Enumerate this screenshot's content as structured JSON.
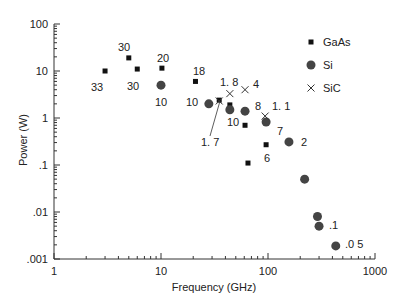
{
  "chart_data": {
    "type": "scatter",
    "title": "",
    "xlabel": "Frequency (GHz)",
    "ylabel": "Power (W)",
    "xscale": "log",
    "yscale": "log",
    "xlim": [
      1,
      1000
    ],
    "ylim": [
      0.001,
      100
    ],
    "x_ticks": [
      "1",
      "10",
      "100",
      "1000"
    ],
    "y_ticks": [
      "100",
      "10",
      "1",
      ".1",
      ".01",
      ".001"
    ],
    "grid": false,
    "legend_position": "upper right",
    "legend": [
      {
        "name": "GaAs",
        "marker": "square"
      },
      {
        "name": "Si",
        "marker": "circle"
      },
      {
        "name": "SiC",
        "marker": "x"
      }
    ],
    "series": [
      {
        "name": "GaAs",
        "marker": "square",
        "points": [
          {
            "x": 3,
            "y": 10
          },
          {
            "x": 5,
            "y": 19
          },
          {
            "x": 6,
            "y": 11
          },
          {
            "x": 10.2,
            "y": 11.5
          },
          {
            "x": 21,
            "y": 6
          },
          {
            "x": 35,
            "y": 2.4
          },
          {
            "x": 44,
            "y": 1.9
          },
          {
            "x": 61,
            "y": 0.7
          },
          {
            "x": 96,
            "y": 0.27
          },
          {
            "x": 65,
            "y": 0.11
          }
        ]
      },
      {
        "name": "Si",
        "marker": "circle",
        "points": [
          {
            "x": 10,
            "y": 5
          },
          {
            "x": 28,
            "y": 2
          },
          {
            "x": 44,
            "y": 1.5
          },
          {
            "x": 61,
            "y": 1.4
          },
          {
            "x": 96,
            "y": 0.82
          },
          {
            "x": 157,
            "y": 0.31
          },
          {
            "x": 220,
            "y": 0.05
          },
          {
            "x": 290,
            "y": 0.008
          },
          {
            "x": 300,
            "y": 0.005
          },
          {
            "x": 430,
            "y": 0.0019
          }
        ]
      },
      {
        "name": "SiC",
        "marker": "x",
        "points": [
          {
            "x": 35,
            "y": 2.3
          },
          {
            "x": 44,
            "y": 3.3
          },
          {
            "x": 61,
            "y": 4
          },
          {
            "x": 94,
            "y": 1.1
          }
        ]
      }
    ],
    "annotations": [
      {
        "text": "33",
        "px": 91,
        "py": 91
      },
      {
        "text": "30",
        "px": 118,
        "py": 51
      },
      {
        "text": "30",
        "px": 127,
        "py": 90
      },
      {
        "text": "20",
        "px": 157,
        "py": 62
      },
      {
        "text": "10",
        "px": 155,
        "py": 106
      },
      {
        "text": "18",
        "px": 193,
        "py": 75
      },
      {
        "text": "10",
        "px": 186,
        "py": 106
      },
      {
        "text": "1. 8",
        "px": 220,
        "py": 86
      },
      {
        "text": "4",
        "px": 253,
        "py": 88
      },
      {
        "text": "8",
        "px": 255,
        "py": 110
      },
      {
        "text": "10",
        "px": 227,
        "py": 126
      },
      {
        "text": "1. 7",
        "px": 201,
        "py": 146
      },
      {
        "text": "1. 1",
        "px": 272,
        "py": 110
      },
      {
        "text": "7",
        "px": 277,
        "py": 135
      },
      {
        "text": "2",
        "px": 301,
        "py": 146
      },
      {
        "text": "6",
        "px": 264,
        "py": 162
      },
      {
        "text": ".1",
        "px": 329,
        "py": 229
      },
      {
        "text": ".0 5",
        "px": 345,
        "py": 248
      }
    ]
  }
}
